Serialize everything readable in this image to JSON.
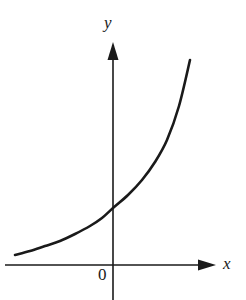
{
  "figure": {
    "background_color": "#ffffff",
    "ink_color": "#1a1a1a",
    "width": 246,
    "height": 300
  },
  "labels": {
    "y_axis": "y",
    "x_axis": "x",
    "origin": "0"
  },
  "chart_data": {
    "type": "line",
    "title": "",
    "subtitle": "",
    "xlabel": "x",
    "ylabel": "y",
    "legend": [],
    "legend_position": "none",
    "grid": false,
    "axes": {
      "x_axis_y_pixel": 265,
      "y_axis_x_pixel": 113,
      "origin_label": "0",
      "x_axis_arrow": "right",
      "y_axis_arrow": "up",
      "x_ticks": [],
      "y_ticks": [],
      "xlim": [
        -2.1,
        2.2
      ],
      "ylim": [
        -0.3,
        4.6
      ]
    },
    "series": [
      {
        "name": "exponential curve",
        "description": "increasing exponential curve, concave up, asymptotic to the x-axis on the left",
        "color": "#1a1a1a",
        "line_width": 2.6,
        "x": [
          -2.1,
          -1.8,
          -1.5,
          -1.2,
          -0.9,
          -0.6,
          -0.3,
          0.0,
          0.3,
          0.6,
          0.9,
          1.2,
          1.5,
          1.7
        ],
        "y": [
          0.21,
          0.29,
          0.38,
          0.49,
          0.62,
          0.78,
          0.95,
          1.16,
          1.42,
          1.76,
          2.17,
          2.69,
          3.47,
          4.19
        ],
        "pixels": [
          [
            15,
            255
          ],
          [
            30,
            251
          ],
          [
            45,
            246
          ],
          [
            60,
            241
          ],
          [
            75,
            234
          ],
          [
            90,
            226
          ],
          [
            102,
            218
          ],
          [
            113,
            208
          ],
          [
            128,
            195
          ],
          [
            142,
            180
          ],
          [
            155,
            162
          ],
          [
            167,
            140
          ],
          [
            179,
            106
          ],
          [
            190,
            60
          ]
        ],
        "y_intercept_pixel": [
          113,
          208
        ],
        "start_pixel": [
          15,
          255
        ],
        "end_pixel": [
          190,
          60
        ]
      }
    ]
  }
}
